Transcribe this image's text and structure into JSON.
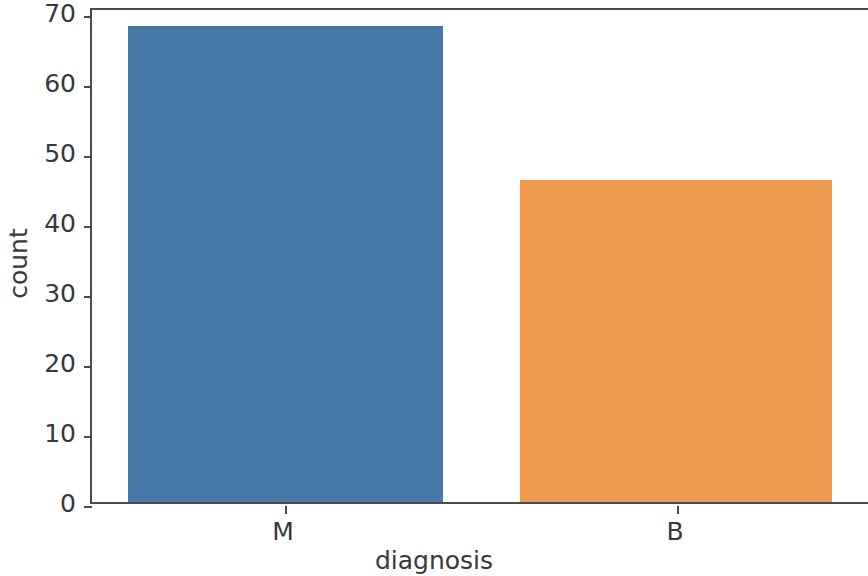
{
  "chart_data": {
    "type": "bar",
    "title": "",
    "xlabel": "diagnosis",
    "ylabel": "count",
    "categories": [
      "M",
      "B"
    ],
    "values": [
      68,
      46
    ],
    "series": [
      {
        "name": "count",
        "values": [
          68,
          46
        ]
      }
    ],
    "colors": [
      "#4878a8",
      "#ee9a4f"
    ],
    "ylim": [
      0,
      70
    ],
    "yticks": [
      0,
      10,
      20,
      30,
      40,
      50,
      60,
      70
    ],
    "ytick_labels": [
      "0",
      "10",
      "20",
      "30",
      "40",
      "50",
      "60",
      "70"
    ],
    "xtick_labels": [
      "M",
      "B"
    ],
    "grid": false,
    "legend": false,
    "legend_position": "none",
    "bars": [
      {
        "category": "M",
        "value": 68,
        "color": "#4878a8"
      },
      {
        "category": "B",
        "value": 46,
        "color": "#ee9a4f"
      }
    ]
  },
  "axes": {
    "spine_color": "#4a4a52",
    "background": "#ffffff",
    "tick_color": "#4a4a52",
    "text_color": "#37373c"
  }
}
